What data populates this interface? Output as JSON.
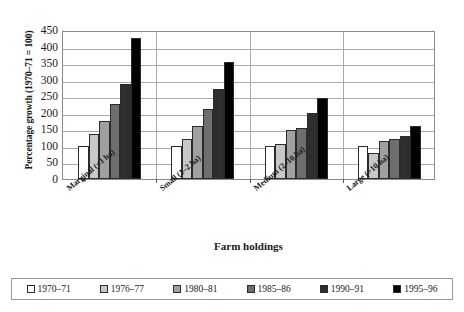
{
  "chart_data": {
    "type": "bar",
    "title": "",
    "xlabel": "Farm holdings",
    "ylabel": "Percentage growth (1970–71 = 100)",
    "categories": [
      "Marginal (<1 ha)",
      "Small (1–2 ha)",
      "Medium (2–10 ha)",
      "Large (>10 ha)"
    ],
    "series": [
      {
        "name": "1970–71",
        "color": "#ffffff",
        "values": [
          100,
          100,
          100,
          100
        ]
      },
      {
        "name": "1976–77",
        "color": "#c8c8c8",
        "values": [
          137,
          120,
          107,
          80
        ]
      },
      {
        "name": "1980–81",
        "color": "#a0a0a0",
        "values": [
          175,
          160,
          147,
          115
        ]
      },
      {
        "name": "1985–86",
        "color": "#6e6e6e",
        "values": [
          228,
          210,
          155,
          120
        ]
      },
      {
        "name": "1990–91",
        "color": "#2e2e2e",
        "values": [
          287,
          272,
          200,
          130
        ]
      },
      {
        "name": "1995–96",
        "color": "#000000",
        "values": [
          425,
          352,
          245,
          160
        ]
      }
    ],
    "ylim": [
      0,
      450
    ],
    "yticks": [
      0,
      50,
      100,
      150,
      200,
      250,
      300,
      350,
      400,
      450
    ],
    "grid": true,
    "legend_position": "bottom"
  },
  "axes": {
    "y_title": "Percentage growth (1970–71 = 100)",
    "x_title": "Farm holdings"
  }
}
